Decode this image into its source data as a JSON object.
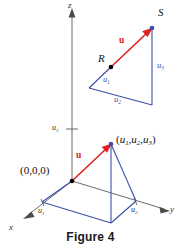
{
  "figure": {
    "caption": "Figure 4",
    "axes": {
      "z_label": "z",
      "x_label": "x",
      "y_label": "y"
    },
    "ticks": {
      "z_tick": "u",
      "z_tick_sub": "3",
      "x_tick": "u",
      "x_tick_sub": "1",
      "y_tick": "u",
      "y_tick_sub": "2"
    },
    "origin_label": "(0,0,0)",
    "point_label": {
      "open": "(",
      "u1": "u",
      "u1_sub": "1",
      "sep1": ",",
      "u2": "u",
      "u2_sub": "2",
      "sep2": ",",
      "u3": "u",
      "u3_sub": "3",
      "close": ")"
    },
    "vector_label_lower": "u",
    "vector_label_upper": "u",
    "upper_triangle": {
      "point_R": "R",
      "point_S": "S",
      "leg_u1": "u",
      "leg_u1_sub": "1",
      "leg_u2": "u",
      "leg_u2_sub": "2",
      "leg_u3": "u",
      "leg_u3_sub": "3"
    },
    "colors": {
      "vector_red": "#e02020",
      "construction_blue": "#3c4fa8",
      "axis_gray": "#6b6b6b",
      "background": "#ffffff",
      "text": "#111111"
    }
  }
}
